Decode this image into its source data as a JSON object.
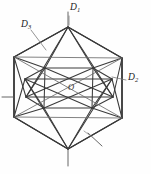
{
  "figure": {
    "name": "icosahedron-symmetry-axes",
    "background_color": "#fefefe",
    "line_color": "#2b2b2b",
    "width": 151,
    "height": 174
  },
  "labels": {
    "center": {
      "text": "O",
      "name": "center-point-label",
      "x": 68,
      "y": 83
    },
    "axis_d1": {
      "base": "D",
      "subscript": "1",
      "name": "five-fold-axis-label",
      "x": 70,
      "y": 3
    },
    "axis_d2": {
      "base": "D",
      "subscript": "2",
      "name": "two-fold-axis-label",
      "x": 128,
      "y": 73
    },
    "axis_d3": {
      "base": "D",
      "subscript": "3",
      "name": "three-fold-axis-label",
      "x": 21,
      "y": 20
    }
  },
  "geometry": {
    "top_apex": [
      68,
      27
    ],
    "bottom_apex": [
      68,
      149
    ],
    "center": [
      69,
      88
    ],
    "hex_outline": [
      [
        68,
        27
      ],
      [
        122,
        58
      ],
      [
        122,
        118
      ],
      [
        68,
        149
      ],
      [
        14,
        117
      ],
      [
        14,
        57
      ]
    ],
    "upper_ring": [
      [
        68,
        27
      ],
      [
        99,
        46
      ],
      [
        112,
        79
      ],
      [
        92,
        108
      ],
      [
        44,
        108
      ],
      [
        25,
        79
      ],
      [
        38,
        46
      ]
    ],
    "lower_ring": [
      [
        68,
        149
      ],
      [
        100,
        130
      ],
      [
        113,
        97
      ],
      [
        93,
        68
      ],
      [
        45,
        68
      ],
      [
        26,
        97
      ],
      [
        39,
        130
      ]
    ]
  },
  "axes": {
    "d1_stub": {
      "x1": 68,
      "y1": 27,
      "x2": 68,
      "y2": 12,
      "name": "d1-axis-stub-top"
    },
    "d1_stub_bottom": {
      "x1": 68,
      "y1": 149,
      "x2": 68,
      "y2": 166,
      "name": "d1-axis-stub-bottom"
    },
    "d2_stub": {
      "x1": 14,
      "y1": 97,
      "x2": 2,
      "y2": 97,
      "name": "d2-axis-stub-left"
    },
    "d3_marker": {
      "x1": 88,
      "y1": 133,
      "x2": 102,
      "y2": 146,
      "name": "d3-axis-marker-lower-right"
    }
  },
  "leaders": {
    "d1": {
      "x1": 73,
      "y1": 15,
      "x2": 69,
      "y2": 25,
      "name": "d1-leader-line"
    },
    "d2": {
      "x1": 126,
      "y1": 80,
      "x2": 112,
      "y2": 76,
      "name": "d2-leader-line"
    },
    "d3": {
      "x1": 31,
      "y1": 30,
      "x2": 46,
      "y2": 50,
      "name": "d3-leader-line"
    }
  }
}
